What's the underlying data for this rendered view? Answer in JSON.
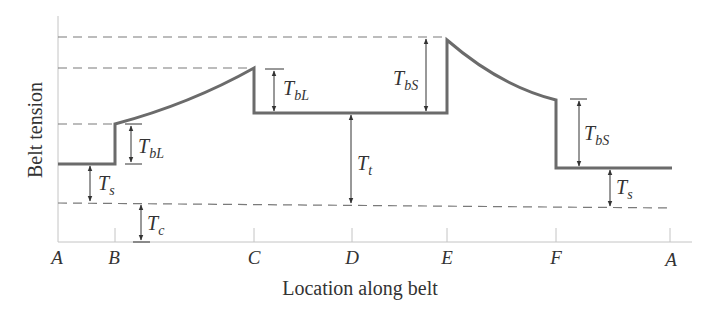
{
  "figure": {
    "ylabel": "Belt tension",
    "xlabel": "Location along belt",
    "x_ticks": [
      "A",
      "B",
      "C",
      "D",
      "E",
      "F",
      "A"
    ],
    "annotations": {
      "TbL_1": {
        "main": "T",
        "sub": "bL"
      },
      "TbL_2": {
        "main": "T",
        "sub": "bL"
      },
      "TbS_1": {
        "main": "T",
        "sub": "bS"
      },
      "TbS_2": {
        "main": "T",
        "sub": "bS"
      },
      "Ts_1": {
        "main": "T",
        "sub": "s"
      },
      "Ts_2": {
        "main": "T",
        "sub": "s"
      },
      "Tt": {
        "main": "T",
        "sub": "t"
      },
      "Tc": {
        "main": "T",
        "sub": "c"
      }
    },
    "colors": {
      "curve": "#6b6b6b",
      "dash": "#7a7a7a",
      "axis": "#bdbdbd",
      "text": "#333333"
    }
  }
}
